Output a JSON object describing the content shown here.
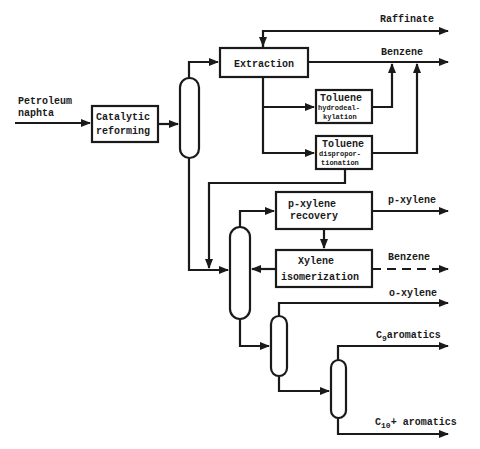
{
  "diagram": {
    "input": {
      "line1": "Petroleum",
      "line2": "naphta"
    },
    "units": {
      "catalytic_reforming": {
        "line1": "Catalytic",
        "line2": "reforming"
      },
      "extraction": {
        "label": "Extraction"
      },
      "toluene_hda": {
        "line1": "Toluene",
        "line2": "hydrodeal-",
        "line3": "kylation"
      },
      "toluene_disp": {
        "line1": "Toluene",
        "line2": "dispropor-",
        "line3": "tionation"
      },
      "pxylene_recovery": {
        "line1": "p-xylene",
        "line2": "recovery"
      },
      "xylene_isomerization": {
        "line1": "Xylene",
        "line2": "isomerization"
      }
    },
    "outputs": {
      "raffinate": "Raffinate",
      "benzene_top": "Benzene",
      "pxylene": "p-xylene",
      "benzene_iso": "Benzene",
      "oxylene": "o-xylene",
      "c9_prefix": "C",
      "c9_sub": "9",
      "c9_suffix": "aromatics",
      "c10_prefix": "C",
      "c10_sub": "10",
      "c10_suffix": "+ aromatics"
    }
  }
}
